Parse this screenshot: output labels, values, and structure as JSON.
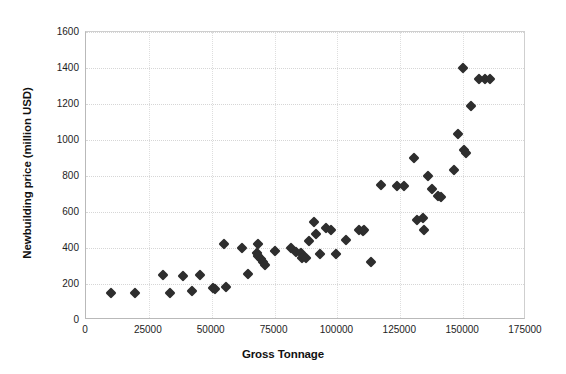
{
  "chart_data": {
    "type": "scatter",
    "title": "",
    "xlabel": "Gross Tonnage",
    "ylabel": "Newbuilding price (million USD)",
    "xlim": [
      0,
      175000
    ],
    "ylim": [
      0,
      1600
    ],
    "xticks": [
      0,
      25000,
      50000,
      75000,
      100000,
      125000,
      150000,
      175000
    ],
    "xtick_labels": [
      "0",
      "25000",
      "50000",
      "75000",
      "100000",
      "125000",
      "150000",
      "175000"
    ],
    "yticks": [
      0,
      200,
      400,
      600,
      800,
      1000,
      1200,
      1400,
      1600
    ],
    "ytick_labels": [
      "0",
      "200",
      "400",
      "600",
      "800",
      "1000",
      "1200",
      "1400",
      "1600"
    ],
    "grid": true,
    "legend": false,
    "marker_shape": "diamond",
    "marker_color": "#2e2e2e",
    "series": [
      {
        "name": "Vessels",
        "points": [
          [
            10000,
            150
          ],
          [
            19500,
            150
          ],
          [
            30500,
            250
          ],
          [
            33500,
            150
          ],
          [
            38500,
            247
          ],
          [
            42000,
            160
          ],
          [
            45500,
            250
          ],
          [
            50500,
            180
          ],
          [
            51500,
            175
          ],
          [
            55000,
            425
          ],
          [
            55500,
            185
          ],
          [
            62000,
            400
          ],
          [
            64500,
            255
          ],
          [
            68500,
            420
          ],
          [
            68000,
            375
          ],
          [
            68500,
            355
          ],
          [
            69500,
            340
          ],
          [
            70500,
            320
          ],
          [
            71000,
            305
          ],
          [
            75000,
            385
          ],
          [
            81500,
            400
          ],
          [
            83500,
            380
          ],
          [
            85500,
            375
          ],
          [
            86000,
            345
          ],
          [
            87500,
            345
          ],
          [
            88500,
            440
          ],
          [
            90500,
            545
          ],
          [
            91500,
            480
          ],
          [
            93000,
            365
          ],
          [
            95500,
            510
          ],
          [
            97500,
            500
          ],
          [
            99500,
            365
          ],
          [
            103500,
            445
          ],
          [
            108500,
            500
          ],
          [
            110000,
            495
          ],
          [
            110500,
            500
          ],
          [
            113500,
            325
          ],
          [
            117500,
            750
          ],
          [
            123500,
            745
          ],
          [
            126500,
            745
          ],
          [
            130500,
            900
          ],
          [
            131500,
            555
          ],
          [
            134000,
            565
          ],
          [
            134500,
            500
          ],
          [
            136000,
            800
          ],
          [
            137500,
            730
          ],
          [
            140000,
            690
          ],
          [
            141000,
            685
          ],
          [
            146500,
            835
          ],
          [
            148000,
            1035
          ],
          [
            150500,
            945
          ],
          [
            151000,
            930
          ],
          [
            150000,
            1400
          ],
          [
            153000,
            1190
          ],
          [
            156500,
            1340
          ],
          [
            158500,
            1340
          ],
          [
            160500,
            1340
          ]
        ]
      }
    ]
  }
}
